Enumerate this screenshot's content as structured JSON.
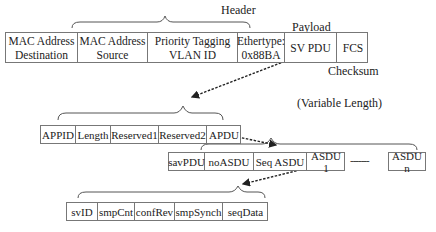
{
  "frame": {
    "header_label": "Header",
    "payload_label": "Payload",
    "checksum_label": "Checksum",
    "fields": [
      {
        "label": "MAC Address\nDestination"
      },
      {
        "label": "MAC Address\nSource"
      },
      {
        "label": "Priority Tagging\nVLAN ID"
      },
      {
        "label": "Ethertype:\n0x88BA"
      },
      {
        "label": "SV PDU"
      },
      {
        "label": "FCS"
      }
    ]
  },
  "sv_pdu": {
    "fields": [
      {
        "label": "APPID"
      },
      {
        "label": "Length"
      },
      {
        "label": "Reserved1"
      },
      {
        "label": "Reserved2"
      },
      {
        "label": "APDU"
      }
    ]
  },
  "apdu": {
    "variable_length_label": "(Variable Length)",
    "fields": [
      {
        "label": "savPDU"
      },
      {
        "label": "noASDU"
      },
      {
        "label": "Seq ASDU"
      },
      {
        "label": "ASDU 1"
      }
    ],
    "ellipsis": "-------",
    "last_field": "ASDU n"
  },
  "asdu": {
    "fields": [
      {
        "label": "svID"
      },
      {
        "label": "smpCnt"
      },
      {
        "label": "confRev"
      },
      {
        "label": "smpSynch"
      },
      {
        "label": "seqData"
      }
    ]
  }
}
